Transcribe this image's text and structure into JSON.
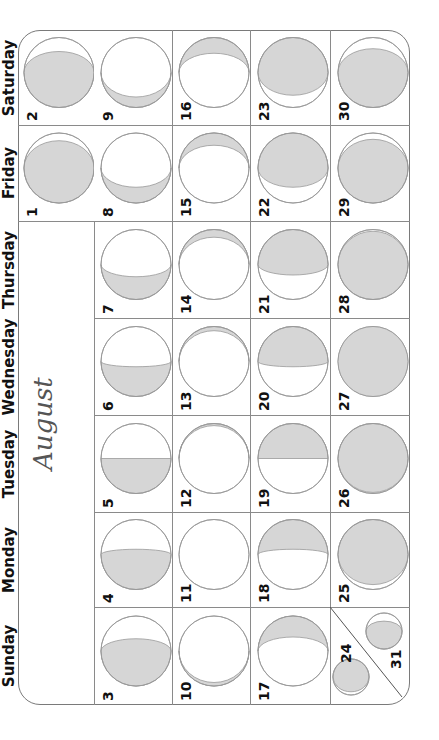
{
  "calendar": {
    "month": "August",
    "days_of_week": [
      "Saturday",
      "Friday",
      "Thursday",
      "Wednesday",
      "Tuesday",
      "Monday",
      "Sunday"
    ],
    "colors": {
      "shade": "#d6d6d6",
      "line": "#8a8a8a",
      "text": "#111111",
      "month_text": "#555555"
    },
    "cells": [
      {
        "date": "1",
        "dow": "Friday",
        "col": 0,
        "row": 1,
        "phase": {
          "lit": "bottom",
          "ry": 0.78
        }
      },
      {
        "date": "2",
        "dow": "Saturday",
        "col": 0,
        "row": 0,
        "phase": {
          "lit": "bottom",
          "ry": 0.6
        }
      },
      {
        "date": "3",
        "dow": "Sunday",
        "col": 1,
        "row": 6,
        "phase": {
          "lit": "bottom",
          "ry": 0.35
        }
      },
      {
        "date": "4",
        "dow": "Monday",
        "col": 1,
        "row": 5,
        "phase": {
          "lit": "bottom",
          "ry": 0.15
        }
      },
      {
        "date": "5",
        "dow": "Tuesday",
        "col": 1,
        "row": 4,
        "phase": {
          "lit": "bottom",
          "ry": 0.0
        }
      },
      {
        "date": "6",
        "dow": "Wednesday",
        "col": 1,
        "row": 3,
        "phase": {
          "lit": "bottom",
          "ry": -0.15
        }
      },
      {
        "date": "7",
        "dow": "Thursday",
        "col": 1,
        "row": 2,
        "phase": {
          "lit": "bottom",
          "ry": -0.35
        }
      },
      {
        "date": "8",
        "dow": "Friday",
        "col": 1,
        "row": 1,
        "phase": {
          "lit": "bottom",
          "ry": -0.55
        }
      },
      {
        "date": "9",
        "dow": "Saturday",
        "col": 1,
        "row": 0,
        "phase": {
          "lit": "bottom",
          "ry": -0.7
        }
      },
      {
        "date": "10",
        "dow": "Sunday",
        "col": 2,
        "row": 6,
        "phase": {
          "lit": "bottom",
          "ry": -0.9
        }
      },
      {
        "date": "11",
        "dow": "Monday",
        "col": 2,
        "row": 5,
        "phase": {
          "lit": "none",
          "ry": -1
        }
      },
      {
        "date": "12",
        "dow": "Tuesday",
        "col": 2,
        "row": 4,
        "phase": {
          "lit": "top",
          "ry": -0.94
        }
      },
      {
        "date": "13",
        "dow": "Wednesday",
        "col": 2,
        "row": 3,
        "phase": {
          "lit": "top",
          "ry": -0.88
        }
      },
      {
        "date": "14",
        "dow": "Thursday",
        "col": 2,
        "row": 2,
        "phase": {
          "lit": "top",
          "ry": -0.78
        }
      },
      {
        "date": "15",
        "dow": "Friday",
        "col": 2,
        "row": 1,
        "phase": {
          "lit": "top",
          "ry": -0.65
        }
      },
      {
        "date": "16",
        "dow": "Saturday",
        "col": 2,
        "row": 0,
        "phase": {
          "lit": "top",
          "ry": -0.55
        }
      },
      {
        "date": "17",
        "dow": "Sunday",
        "col": 3,
        "row": 6,
        "phase": {
          "lit": "top",
          "ry": -0.4
        }
      },
      {
        "date": "18",
        "dow": "Monday",
        "col": 3,
        "row": 5,
        "phase": {
          "lit": "top",
          "ry": -0.15
        }
      },
      {
        "date": "19",
        "dow": "Tuesday",
        "col": 3,
        "row": 4,
        "phase": {
          "lit": "top",
          "ry": 0.0
        }
      },
      {
        "date": "20",
        "dow": "Wednesday",
        "col": 3,
        "row": 3,
        "phase": {
          "lit": "top",
          "ry": 0.15
        }
      },
      {
        "date": "21",
        "dow": "Thursday",
        "col": 3,
        "row": 2,
        "phase": {
          "lit": "top",
          "ry": 0.3
        }
      },
      {
        "date": "22",
        "dow": "Friday",
        "col": 3,
        "row": 1,
        "phase": {
          "lit": "top",
          "ry": 0.55
        }
      },
      {
        "date": "23",
        "dow": "Saturday",
        "col": 3,
        "row": 0,
        "phase": {
          "lit": "top",
          "ry": 0.65
        }
      },
      {
        "date": "25",
        "dow": "Monday",
        "col": 4,
        "row": 5,
        "phase": {
          "lit": "top",
          "ry": 0.86
        }
      },
      {
        "date": "26",
        "dow": "Tuesday",
        "col": 4,
        "row": 4,
        "phase": {
          "lit": "top",
          "ry": 0.97
        }
      },
      {
        "date": "27",
        "dow": "Wednesday",
        "col": 4,
        "row": 3,
        "phase": {
          "lit": "full",
          "ry": 1
        }
      },
      {
        "date": "28",
        "dow": "Thursday",
        "col": 4,
        "row": 2,
        "phase": {
          "lit": "bottom",
          "ry": 0.95
        }
      },
      {
        "date": "29",
        "dow": "Friday",
        "col": 4,
        "row": 1,
        "phase": {
          "lit": "bottom",
          "ry": 0.82
        }
      },
      {
        "date": "30",
        "dow": "Saturday",
        "col": 4,
        "row": 0,
        "phase": {
          "lit": "bottom",
          "ry": 0.68
        }
      }
    ],
    "split_cell": {
      "dow": "Sunday",
      "first": {
        "date": "24",
        "phase": {
          "lit": "top",
          "ry": 0.82
        }
      },
      "second": {
        "date": "31",
        "phase": {
          "lit": "bottom",
          "ry": 0.55
        }
      }
    }
  }
}
